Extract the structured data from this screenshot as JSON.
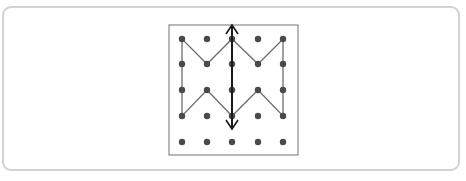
{
  "figure": {
    "outer_border_color": "#d2d2d2",
    "grid": {
      "rows": 5,
      "cols": 5,
      "x": [
        182,
        207,
        232,
        258,
        283
      ],
      "y": [
        39,
        64,
        90,
        116,
        142
      ],
      "dot_color": "#4a4a4a"
    },
    "frame": {
      "x": 169,
      "y": 25,
      "width": 129,
      "height": 130,
      "color": "#8a8a8a"
    },
    "shape_polygon_grid_points": [
      [
        0,
        0
      ],
      [
        0,
        3
      ],
      [
        1,
        2
      ],
      [
        2,
        3
      ],
      [
        3,
        2
      ],
      [
        4,
        3
      ],
      [
        4,
        0
      ],
      [
        3,
        1
      ],
      [
        2,
        0
      ],
      [
        1,
        1
      ]
    ],
    "shape_color": "#6e6e6e",
    "symmetry_arrow": {
      "x": 232,
      "y_top": 25,
      "y_bottom": 129,
      "color": "#1a1a1a",
      "double_headed": true
    }
  }
}
